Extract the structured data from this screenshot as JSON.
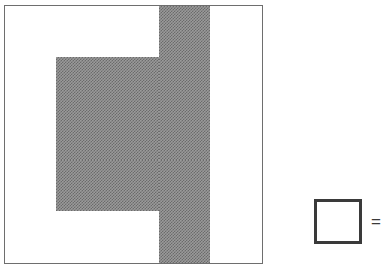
{
  "figure": {
    "type": "shaded-grid-diagram",
    "grid": {
      "rows": 5,
      "columns": 5,
      "cell_width_px": 51.5,
      "cell_height_px": 51.5,
      "line_color": "#6e6e6e",
      "shaded_fill_color": "#9a9a9a",
      "unshaded_fill_color": "#ffffff",
      "shaded_cells_by_row": [
        [
          false,
          false,
          false,
          true,
          false
        ],
        [
          false,
          true,
          true,
          true,
          false
        ],
        [
          false,
          true,
          true,
          true,
          false
        ],
        [
          false,
          true,
          true,
          true,
          false
        ],
        [
          false,
          false,
          false,
          true,
          false
        ]
      ],
      "shaded_count": 11,
      "total_count": 25,
      "shape_description": "cross",
      "bottom_row_clipped": true
    },
    "legend": {
      "swatch_fill": "#ffffff",
      "swatch_border_color": "#3a3a3a",
      "equals_sign": "=",
      "label": ""
    }
  }
}
